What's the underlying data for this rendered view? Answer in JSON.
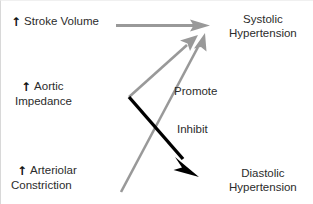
{
  "diagram": {
    "background_color": "#ffffff",
    "promote_color": "#999999",
    "inhibit_color": "#000000",
    "text_color": "#2b2b2b",
    "up_arrow_glyph": "↑",
    "nodes": {
      "stroke_volume": {
        "arrow": "↑",
        "label": "Stroke Volume"
      },
      "aortic_impedance": {
        "arrow": "↑",
        "line1": "Aortic",
        "line2": "Impedance"
      },
      "arteriolar_constriction": {
        "arrow": "↑",
        "line1": "Arteriolar",
        "line2": "Constriction"
      },
      "systolic_hypertension": {
        "line1": "Systolic",
        "line2": "Hypertension"
      },
      "diastolic_hypertension": {
        "line1": "Diastolic",
        "line2": "Hypertension"
      }
    },
    "edge_labels": {
      "promote": "Promote",
      "inhibit": "Inhibit"
    },
    "edges": [
      {
        "name": "stroke-volume-to-systolic",
        "from": "stroke_volume",
        "to": "systolic_hypertension",
        "relation": "Promote",
        "color": "#999999"
      },
      {
        "name": "aortic-impedance-to-systolic",
        "from": "aortic_impedance",
        "to": "systolic_hypertension",
        "relation": "Promote",
        "color": "#999999"
      },
      {
        "name": "arteriolar-constriction-to-systolic",
        "from": "arteriolar_constriction",
        "to": "systolic_hypertension",
        "relation": "Promote",
        "color": "#999999"
      },
      {
        "name": "aortic-impedance-to-diastolic",
        "from": "aortic_impedance",
        "to": "diastolic_hypertension",
        "relation": "Inhibit",
        "color": "#000000"
      }
    ]
  }
}
